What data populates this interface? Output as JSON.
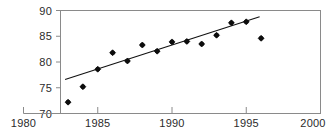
{
  "chart_data": {
    "type": "scatter",
    "title": "",
    "xlabel": "",
    "ylabel": "",
    "xlim": [
      1980,
      2000
    ],
    "ylim": [
      70,
      90
    ],
    "grid": false,
    "legend": null,
    "x_ticks": [
      "1980",
      "1985",
      "1990",
      "1995",
      "2000"
    ],
    "x_tick_values": [
      1980,
      1985,
      1990,
      1995,
      2000
    ],
    "y_ticks": [
      "70",
      "75",
      "80",
      "85",
      "90"
    ],
    "y_tick_values": [
      70,
      75,
      80,
      85,
      90
    ],
    "x": [
      1983,
      1984,
      1985,
      1986,
      1987,
      1988,
      1989,
      1990,
      1991,
      1992,
      1993,
      1994,
      1995,
      1996
    ],
    "values": [
      72.2,
      75.2,
      78.6,
      81.8,
      80.2,
      83.3,
      82.1,
      83.9,
      84.0,
      83.5,
      85.2,
      87.6,
      87.8,
      84.6
    ],
    "series": [
      {
        "name": "observations",
        "marker": "filled-diamond",
        "x": [
          1983,
          1984,
          1985,
          1986,
          1987,
          1988,
          1989,
          1990,
          1991,
          1992,
          1993,
          1994,
          1995,
          1996
        ],
        "values": [
          72.2,
          75.2,
          78.6,
          81.8,
          80.2,
          83.3,
          82.1,
          83.9,
          84.0,
          83.5,
          85.2,
          87.6,
          87.8,
          84.6
        ]
      },
      {
        "name": "trend-line",
        "marker": "line",
        "x": [
          1982.8,
          1995.9
        ],
        "values": [
          76.6,
          88.8
        ]
      }
    ],
    "colors": {
      "marker": "#0d0d0d",
      "trend": "#111111",
      "axis": "#8a8a8a",
      "label": "#2b2b2b",
      "background": "#ffffff"
    }
  }
}
